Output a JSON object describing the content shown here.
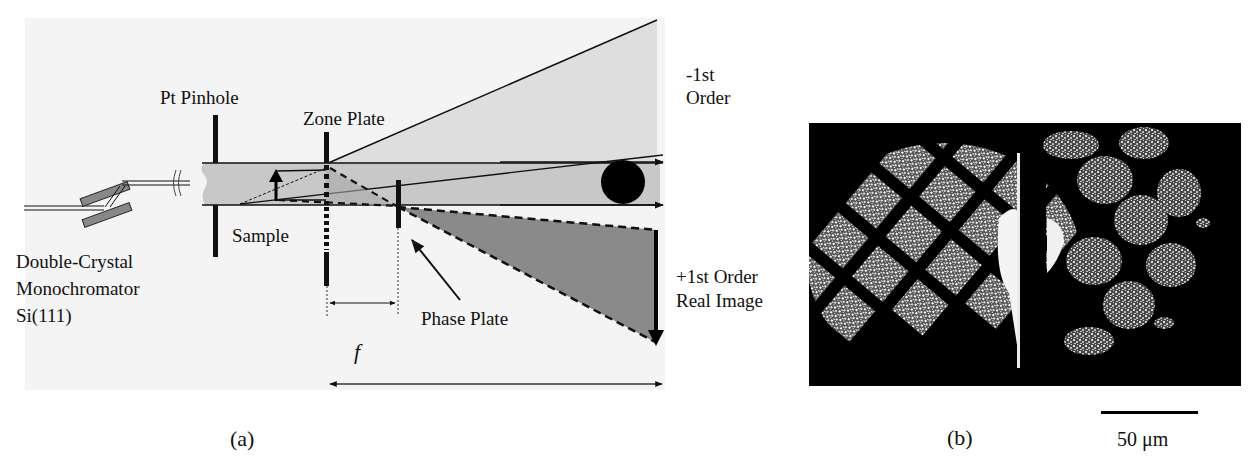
{
  "figure": {
    "panel_a": {
      "caption": "(a)",
      "labels": {
        "monochromator": [
          "Double-Crystal",
          "Monochromator",
          "Si(111)"
        ],
        "pinhole": "Pt Pinhole",
        "zone_plate": "Zone Plate",
        "sample": "Sample",
        "phase_plate": "Phase Plate",
        "minus_first_order": [
          "-1st",
          "Order"
        ],
        "plus_first_order": [
          "+1st Order",
          "Real Image"
        ],
        "focal_length": "f"
      }
    },
    "panel_b": {
      "caption": "(b)",
      "scale_bar_label": "50 μm"
    }
  },
  "colors": {
    "beam_fill": "#c8c8c8",
    "minus_order_fill": "#dedede",
    "plus_order_fill": "#8a8a8a",
    "background_panel": "#f4f4f4",
    "ink": "#111111"
  }
}
